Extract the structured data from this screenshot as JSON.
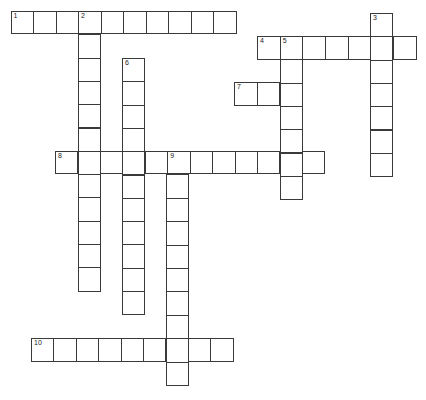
{
  "puzzle": {
    "type": "crossword",
    "words": [
      {
        "number": "1",
        "direction": "across",
        "length": 10,
        "x": 10.5,
        "y": 11,
        "pitch": 22.5,
        "cell_h": 23
      },
      {
        "number": "2",
        "direction": "down",
        "length": 12,
        "x": 78,
        "y": 11,
        "pitch": 23.3,
        "cell_w": 22.5
      },
      {
        "number": "3",
        "direction": "down",
        "length": 7,
        "x": 370,
        "y": 13,
        "pitch": 23.3,
        "cell_w": 23
      },
      {
        "number": "4",
        "direction": "across",
        "length": 7,
        "x": 257,
        "y": 36,
        "pitch": 22.7,
        "cell_h": 23.5
      },
      {
        "number": "5",
        "direction": "down",
        "length": 7,
        "x": 280,
        "y": 36,
        "pitch": 23.3,
        "cell_w": 22.5
      },
      {
        "number": "6",
        "direction": "down",
        "length": 11,
        "x": 122,
        "y": 58,
        "pitch": 23.3,
        "cell_w": 22.5
      },
      {
        "number": "7",
        "direction": "across",
        "length": 3,
        "x": 234,
        "y": 82,
        "pitch": 22.7,
        "cell_h": 23.5
      },
      {
        "number": "8",
        "direction": "across",
        "length": 12,
        "x": 55,
        "y": 151,
        "pitch": 22.45,
        "cell_h": 23
      },
      {
        "number": "9",
        "direction": "down",
        "length": 10,
        "x": 166,
        "y": 151,
        "pitch": 23.4,
        "cell_w": 23
      },
      {
        "number": "10",
        "direction": "across",
        "length": 9,
        "x": 31,
        "y": 338,
        "pitch": 22.4,
        "cell_h": 23.5
      }
    ],
    "colors": {
      "border": "#3a3a3a",
      "background": "#ffffff",
      "number": "#222222"
    }
  }
}
